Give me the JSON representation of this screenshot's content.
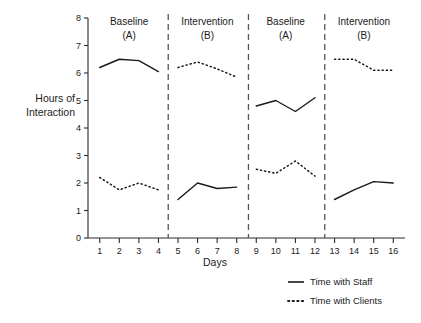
{
  "chart_data": {
    "type": "line",
    "title": "",
    "xlabel": "Days",
    "ylabel": "Hours of Interaction",
    "xlim": [
      0.4,
      16.6
    ],
    "ylim": [
      0,
      8
    ],
    "yticks": [
      0,
      1,
      2,
      3,
      4,
      5,
      6,
      7,
      8
    ],
    "grid": false,
    "legend_position": "bottom-right",
    "x": [
      1,
      2,
      3,
      4,
      5,
      6,
      7,
      8,
      9,
      10,
      11,
      12,
      13,
      14,
      15,
      16
    ],
    "xticklabels": [
      "1",
      "2",
      "3",
      "4",
      "5",
      "6",
      "7",
      "8",
      "9",
      "10",
      "11",
      "12",
      "13",
      "14",
      "15",
      "16"
    ],
    "series": [
      {
        "name": "Time with Staff",
        "style": "solid",
        "segments": [
          {
            "phase": "Baseline (A)",
            "x": [
              1,
              2,
              3,
              4
            ],
            "values": [
              6.2,
              6.5,
              6.45,
              6.05
            ]
          },
          {
            "phase": "Intervention (B)",
            "x": [
              5,
              6,
              7,
              8
            ],
            "values": [
              1.4,
              2.0,
              1.8,
              1.85
            ]
          },
          {
            "phase": "Baseline (A)",
            "x": [
              9,
              10,
              11,
              12
            ],
            "values": [
              4.8,
              5.0,
              4.6,
              5.1
            ]
          },
          {
            "phase": "Intervention (B)",
            "x": [
              13,
              14,
              15,
              16
            ],
            "values": [
              1.4,
              1.75,
              2.05,
              2.0
            ]
          }
        ]
      },
      {
        "name": "Time with Clients",
        "style": "dotted",
        "segments": [
          {
            "phase": "Baseline (A)",
            "x": [
              1,
              2,
              3,
              4
            ],
            "values": [
              2.2,
              1.75,
              2.0,
              1.75
            ]
          },
          {
            "phase": "Intervention (B)",
            "x": [
              5,
              6,
              7,
              8
            ],
            "values": [
              6.2,
              6.4,
              6.15,
              5.85
            ]
          },
          {
            "phase": "Baseline (A)",
            "x": [
              9,
              10,
              11,
              12
            ],
            "values": [
              2.5,
              2.35,
              2.8,
              2.25
            ]
          },
          {
            "phase": "Intervention (B)",
            "x": [
              13,
              14,
              15,
              16
            ],
            "values": [
              6.5,
              6.5,
              6.1,
              6.1
            ]
          }
        ]
      }
    ],
    "phases": [
      {
        "label_line1": "Baseline",
        "label_line2": "(A)",
        "x_start": 1,
        "x_end": 4
      },
      {
        "label_line1": "Intervention",
        "label_line2": "(B)",
        "x_start": 5,
        "x_end": 8
      },
      {
        "label_line1": "Baseline",
        "label_line2": "(A)",
        "x_start": 9,
        "x_end": 12
      },
      {
        "label_line1": "Intervention",
        "label_line2": "(B)",
        "x_start": 13,
        "x_end": 16
      }
    ],
    "phase_dividers": [
      4.5,
      8.6,
      12.5
    ],
    "legend": [
      {
        "label": "Time with Staff",
        "style": "solid"
      },
      {
        "label": "Time with Clients",
        "style": "dotted"
      }
    ]
  },
  "axis": {
    "ylabel_line1": "Hours of",
    "ylabel_line2": "Interaction",
    "xlabel": "Days"
  }
}
